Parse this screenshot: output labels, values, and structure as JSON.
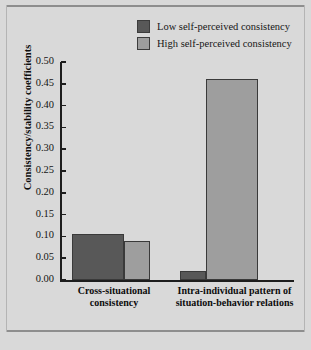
{
  "figure": {
    "background_color": "#d9d9d9",
    "frame_color": "#8e8e8e"
  },
  "legend": {
    "position": "top-right",
    "entries": [
      {
        "label": "Low self-perceived consistency",
        "color": "#585858",
        "swatch_name": "legend-swatch-low"
      },
      {
        "label": "High self-perceived consistency",
        "color": "#9e9e9e",
        "swatch_name": "legend-swatch-high"
      }
    ]
  },
  "axes": {
    "y_title": "Consistency/stability coefficients",
    "y_ticks": [
      "0.50",
      "0.45",
      "0.40",
      "0.35",
      "0.30",
      "0.25",
      "0.20",
      "0.15",
      "0.10",
      "0.05",
      "0.00"
    ],
    "x_categories": [
      "Cross-situational consistency",
      "Intra-individual pattern of situation-behavior relations"
    ]
  },
  "chart_data": {
    "type": "bar",
    "title": "",
    "subtitle": "",
    "xlabel": "",
    "ylabel": "Consistency/stability coefficients",
    "ylim": [
      0.0,
      0.5
    ],
    "ytick_interval": 0.05,
    "grid": false,
    "legend_position": "top-right",
    "categories": [
      "Cross-situational consistency",
      "Intra-individual pattern of situation-behavior relations"
    ],
    "series": [
      {
        "name": "Low self-perceived consistency",
        "color": "#585858",
        "values": [
          0.105,
          0.02
        ]
      },
      {
        "name": "High self-perceived consistency",
        "color": "#9e9e9e",
        "values": [
          0.09,
          0.46
        ]
      }
    ]
  }
}
